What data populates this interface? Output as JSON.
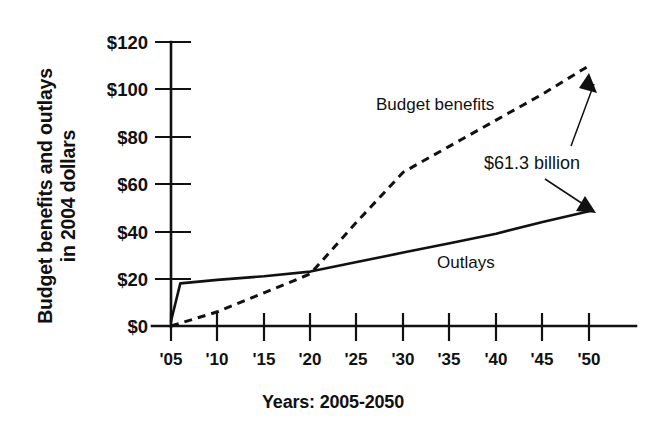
{
  "chart_data": {
    "type": "line",
    "title": "",
    "xlabel": "Years: 2005-2050",
    "ylabel_line1": "Budget benefits and outlays",
    "ylabel_line2": "in 2004 dollars",
    "x_tick_labels": [
      "'05",
      "'10",
      "'15",
      "'20",
      "'25",
      "'30",
      "'35",
      "'40",
      "'45",
      "'50"
    ],
    "x_tick_values": [
      2005,
      2010,
      2015,
      2020,
      2025,
      2030,
      2035,
      2040,
      2045,
      2050
    ],
    "y_tick_labels": [
      "$0",
      "$20",
      "$40",
      "$60",
      "$80",
      "$100",
      "$120"
    ],
    "y_tick_values": [
      0,
      20,
      40,
      60,
      80,
      100,
      120
    ],
    "xlim": [
      2005,
      2050
    ],
    "ylim": [
      0,
      120
    ],
    "grid": false,
    "legend_position": "inline-annotations",
    "series": [
      {
        "name": "Budget benefits",
        "style": "dashed",
        "label": "Budget benefits",
        "x": [
          2005,
          2010,
          2015,
          2020,
          2025,
          2030,
          2035,
          2040,
          2045,
          2050
        ],
        "values": [
          0,
          6,
          14,
          22,
          44,
          65,
          76,
          87,
          98,
          110
        ]
      },
      {
        "name": "Outlays",
        "style": "solid",
        "label": "Outlays",
        "x": [
          2005,
          2006,
          2010,
          2015,
          2020,
          2025,
          2030,
          2035,
          2040,
          2045,
          2050
        ],
        "values": [
          2,
          18,
          19.5,
          21,
          23,
          27,
          31,
          35,
          39,
          44,
          48.5
        ]
      }
    ],
    "annotations": [
      {
        "text": "$61.3 billion",
        "note": "gap between budget benefits and outlays in 2050",
        "value": 61.3,
        "units": "billion 2004 dollars",
        "points_to": [
          "Budget benefits 2050 endpoint",
          "Outlays 2050 endpoint"
        ]
      }
    ],
    "colors": {
      "ink": "#111111",
      "background": "#ffffff"
    }
  }
}
